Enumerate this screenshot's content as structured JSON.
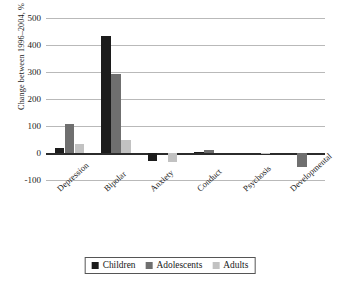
{
  "chart_data": {
    "type": "bar",
    "title": "",
    "subtitle": "",
    "xlabel": "",
    "ylabel": "Change between 1996–2004, %",
    "ylim": [
      -100,
      500
    ],
    "ytick_labels": [
      "500",
      "400",
      "300",
      "200",
      "100",
      "0",
      "-100"
    ],
    "ytick_values": [
      500,
      400,
      300,
      200,
      100,
      0,
      -100
    ],
    "grid": "horizontal",
    "legend_position": "bottom",
    "categories": [
      "Depression",
      "Bipolar",
      "Anxiety",
      "Conduct",
      "Psychosis",
      "Developmental"
    ],
    "series": [
      {
        "name": "Children",
        "color": "#1c1c1c",
        "values": [
          18,
          435,
          -28,
          5,
          0,
          0
        ]
      },
      {
        "name": "Adolescents",
        "color": "#6f6f6f",
        "values": [
          108,
          293,
          0,
          10,
          0,
          -50
        ]
      },
      {
        "name": "Adults",
        "color": "#c2c2c2",
        "values": [
          35,
          50,
          -32,
          0,
          -5,
          0
        ]
      }
    ]
  },
  "legend": {
    "items": [
      {
        "label": "Children"
      },
      {
        "label": "Adolescents"
      },
      {
        "label": "Adults"
      }
    ]
  }
}
